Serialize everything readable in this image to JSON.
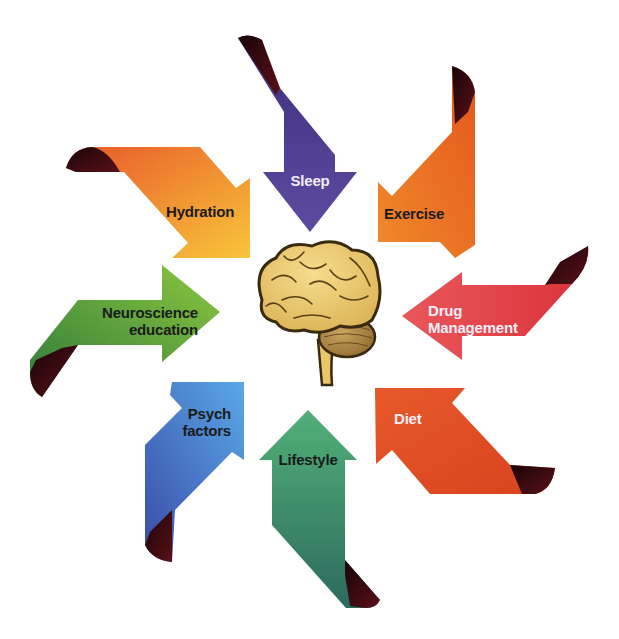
{
  "diagram": {
    "center": {
      "label": "Brain",
      "icon": "brain-icon",
      "colors": {
        "cerebrum": "#e9c66a",
        "cerebellum": "#b8904a",
        "outline": "#3a2a10"
      }
    },
    "arrows": [
      {
        "id": "sleep",
        "label": "Sleep",
        "direction": "down",
        "color_start": "#3f2f7e",
        "color_end": "#5c4ba0",
        "fold_color": "#2a0f1a",
        "text_color": "#f3eef7"
      },
      {
        "id": "exercise",
        "label": "Exercise",
        "direction": "down-left",
        "color_start": "#e4571c",
        "color_end": "#f08a2a",
        "fold_color": "#3a0d0d",
        "text_color": "#1a1a1a"
      },
      {
        "id": "drug-management",
        "label_line1": "Drug",
        "label_line2": "Management",
        "direction": "left",
        "color_start": "#d9333a",
        "color_end": "#e9575b",
        "fold_color": "#3a0d0d",
        "text_color": "#f3eef7"
      },
      {
        "id": "diet",
        "label": "Diet",
        "direction": "up-left",
        "color_start": "#e14a21",
        "color_end": "#e8582a",
        "fold_color": "#2a0606",
        "text_color": "#f3eef7"
      },
      {
        "id": "lifestyle",
        "label": "Lifestyle",
        "direction": "up",
        "color_start": "#52b078",
        "color_end": "#2c6a5e",
        "fold_color": "#3a0d12",
        "text_color": "#1a1a1a"
      },
      {
        "id": "psych-factors",
        "label_line1": "Psych",
        "label_line2": "factors",
        "direction": "up-right",
        "color_start": "#3a4aa8",
        "color_end": "#5aa8e6",
        "fold_color": "#3a0d12",
        "text_color": "#1a1a1a"
      },
      {
        "id": "neuroscience-education",
        "label_line1": "Neuroscience",
        "label_line2": "education",
        "direction": "right",
        "color_start": "#2f7a3a",
        "color_end": "#8cc63f",
        "fold_color": "#3a0d0d",
        "text_color": "#1a1a1a"
      },
      {
        "id": "hydration",
        "label": "Hydration",
        "direction": "down-right",
        "color_start": "#e8582a",
        "color_end": "#f8c53a",
        "fold_color": "#2a0a0a",
        "text_color": "#1a1a1a"
      }
    ]
  }
}
